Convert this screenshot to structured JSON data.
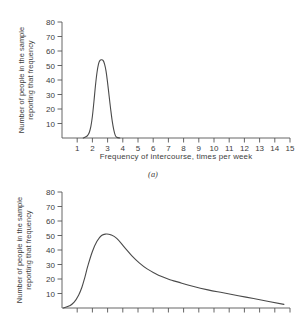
{
  "figure": {
    "sub_caption_a": "(a)"
  },
  "panel_a": {
    "y_axis_title_line1": "Number of people in the sample",
    "y_axis_title_line2": "reporting that frequency",
    "x_axis_title": "Frequency of intercourse, times per week",
    "y_ticks": [
      "10",
      "20",
      "30",
      "40",
      "50",
      "60",
      "70",
      "80"
    ],
    "x_ticks": [
      "1",
      "2",
      "3",
      "4",
      "5",
      "6",
      "7",
      "8",
      "9",
      "10",
      "11",
      "12",
      "13",
      "14",
      "15"
    ]
  },
  "panel_b": {
    "y_axis_title_line1": "Number of people in the sample",
    "y_axis_title_line2": "reporting that frequency",
    "y_ticks": [
      "10",
      "20",
      "30",
      "40",
      "50",
      "60",
      "70",
      "80"
    ],
    "x_ticks": [
      "",
      "",
      "",
      "",
      "",
      "",
      "",
      "",
      "",
      "",
      "",
      "",
      "",
      "",
      ""
    ]
  },
  "chart_data": [
    {
      "type": "line",
      "id": "panel-a",
      "title": "(a)",
      "xlabel": "Frequency of intercourse, times per week",
      "ylabel": "Number of people in the sample reporting that frequency",
      "xlim": [
        0.4,
        15.4
      ],
      "ylim": [
        0,
        80
      ],
      "xticks": [
        1,
        2,
        3,
        4,
        5,
        6,
        7,
        8,
        9,
        10,
        11,
        12,
        13,
        14,
        15
      ],
      "yticks": [
        10,
        20,
        30,
        40,
        50,
        60,
        70,
        80
      ],
      "grid": false,
      "legend": null,
      "series": [
        {
          "name": "narrow symmetric distribution",
          "description": "Tall narrow bell curve peaking at about 54 people at 3 times per week, nearly zero outside 2 to 4.",
          "x": [
            1.8,
            2.0,
            2.1,
            2.2,
            2.3,
            2.4,
            2.5,
            2.6,
            2.7,
            2.8,
            2.9,
            3.0,
            3.1,
            3.2,
            3.3,
            3.4,
            3.5,
            3.6,
            3.7,
            3.8,
            3.9,
            4.0,
            4.2
          ],
          "y": [
            0,
            1,
            2,
            4,
            8,
            15,
            25,
            36,
            45,
            51,
            53.5,
            54,
            53.5,
            51,
            46,
            38,
            29,
            20,
            12,
            6,
            2,
            0.5,
            0
          ]
        }
      ]
    },
    {
      "type": "line",
      "id": "panel-b",
      "title": "(b)",
      "xlabel": "",
      "ylabel": "Number of people in the sample reporting that frequency",
      "xlim": [
        0.4,
        15.4
      ],
      "ylim": [
        0,
        80
      ],
      "xticks": [
        1,
        2,
        3,
        4,
        5,
        6,
        7,
        8,
        9,
        10,
        11,
        12,
        13,
        14,
        15
      ],
      "yticks": [
        10,
        20,
        30,
        40,
        50,
        60,
        70,
        80
      ],
      "grid": false,
      "legend": null,
      "series": [
        {
          "name": "right-skewed distribution",
          "description": "Positively skewed curve rising steeply to a peak of about 51 people near 3.5 times per week, then a long tail decaying toward zero at 15.",
          "x": [
            0.5,
            0.9,
            1.2,
            1.5,
            1.7,
            1.9,
            2.1,
            2.4,
            2.7,
            3.0,
            3.3,
            3.6,
            4.0,
            4.5,
            5.0,
            5.5,
            6.0,
            6.5,
            7.0,
            7.5,
            8.0,
            9.0,
            10.0,
            11.0,
            12.0,
            13.0,
            14.0,
            15.0
          ],
          "y": [
            0,
            1.5,
            4,
            9,
            14,
            21,
            29,
            39,
            46,
            50,
            51,
            50.5,
            48,
            42,
            36,
            31,
            27,
            24,
            21.5,
            19.5,
            18,
            15,
            12.5,
            10.5,
            8.5,
            6.5,
            4.5,
            2.5
          ]
        }
      ]
    }
  ]
}
